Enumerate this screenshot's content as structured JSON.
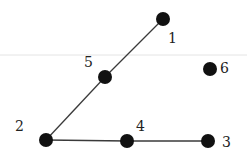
{
  "diagram": {
    "type": "graph",
    "nodes": [
      {
        "id": "1",
        "label": "1",
        "x": 163,
        "y": 19,
        "lx": 168,
        "ly": 43
      },
      {
        "id": "2",
        "label": "2",
        "x": 46,
        "y": 140,
        "lx": 15,
        "ly": 131
      },
      {
        "id": "3",
        "label": "3",
        "x": 208,
        "y": 141,
        "lx": 222,
        "ly": 147
      },
      {
        "id": "4",
        "label": "4",
        "x": 127,
        "y": 141,
        "lx": 136,
        "ly": 131
      },
      {
        "id": "5",
        "label": "5",
        "x": 105,
        "y": 77,
        "lx": 84,
        "ly": 67
      },
      {
        "id": "6",
        "label": "6",
        "x": 210,
        "y": 69,
        "lx": 220,
        "ly": 73
      }
    ],
    "edges": [
      {
        "from": "1",
        "to": "5"
      },
      {
        "from": "5",
        "to": "2"
      },
      {
        "from": "2",
        "to": "4"
      },
      {
        "from": "4",
        "to": "3"
      }
    ],
    "node_radius": 7,
    "colors": {
      "node": "#111111",
      "edge": "#3a3a3a",
      "label": "#222222"
    }
  }
}
